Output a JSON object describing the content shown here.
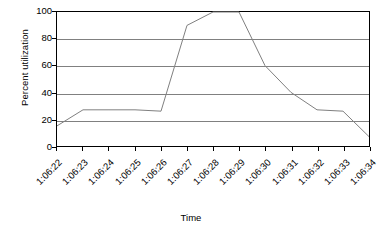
{
  "chart_data": {
    "type": "line",
    "title": "",
    "xlabel": "Time",
    "ylabel": "Percent utilization",
    "ylim": [
      0,
      100
    ],
    "yticks": [
      0,
      20,
      40,
      60,
      80,
      100
    ],
    "grid": true,
    "legend": false,
    "legend_position": "none",
    "line_color": "#808080",
    "categories": [
      "1:06:22",
      "1:06:23",
      "1:06:24",
      "1:06:25",
      "1:06:26",
      "1:06:27",
      "1:06:28",
      "1:06:29",
      "1:06:30",
      "1:06:31",
      "1:06:32",
      "1:06:33",
      "1:06:34"
    ],
    "values": [
      15,
      27,
      27,
      27,
      26,
      90,
      100,
      100,
      60,
      40,
      27,
      26,
      7
    ],
    "series": [
      {
        "name": "Percent utilization",
        "values": [
          15,
          27,
          27,
          27,
          26,
          90,
          100,
          100,
          60,
          40,
          27,
          26,
          7
        ]
      }
    ]
  },
  "axes": {
    "y_title": "Percent utilization",
    "x_title": "Time",
    "y_tick_labels": [
      "100",
      "80",
      "60",
      "40",
      "20",
      "0"
    ],
    "x_tick_labels": [
      "1:06:22",
      "1:06:23",
      "1:06:24",
      "1:06:25",
      "1:06:26",
      "1:06:27",
      "1:06:28",
      "1:06:29",
      "1:06:30",
      "1:06:31",
      "1:06:32",
      "1:06:33",
      "1:06:34"
    ]
  },
  "colors": {
    "line": "#808080",
    "grid": "#808080",
    "frame": "#000000",
    "text": "#000000",
    "background": "#ffffff"
  }
}
